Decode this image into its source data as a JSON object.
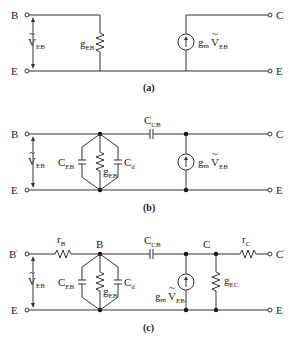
{
  "figure": {
    "panels": [
      {
        "id": "a",
        "caption": "(a)",
        "terminals": {
          "left_top": "B",
          "left_bottom": "E",
          "right_top": "C",
          "right_bottom": "E"
        },
        "voltage": {
          "main": "V",
          "sub": "EB",
          "mark": "~"
        },
        "components": {
          "g_eb": {
            "main": "g",
            "sub": "EB"
          },
          "source": {
            "main": "g",
            "sub_m": "m",
            "v": "V",
            "v_sub": "EB",
            "mark": "~"
          }
        }
      },
      {
        "id": "b",
        "caption": "(b)",
        "terminals": {
          "left_top": "B",
          "left_bottom": "E",
          "right_top": "C",
          "right_bottom": "E"
        },
        "voltage": {
          "main": "V",
          "sub": "EB",
          "mark": "~"
        },
        "components": {
          "c_eb": {
            "main": "C",
            "sub": "EB"
          },
          "g_eb": {
            "main": "g",
            "sub": "EB"
          },
          "c_d": {
            "main": "C",
            "sub": "d"
          },
          "c_cb": {
            "main": "C",
            "sub": "CB"
          },
          "source": {
            "main": "g",
            "sub_m": "m",
            "v": "V",
            "v_sub": "EB",
            "mark": "~"
          }
        }
      },
      {
        "id": "c",
        "caption": "(c)",
        "terminals": {
          "left_top": "B",
          "left_top_prime": "'",
          "left_bottom": "E",
          "right_top": "C",
          "right_top_prime": "'",
          "right_bottom": "E"
        },
        "nodes": {
          "b": "B",
          "c": "C"
        },
        "voltage": {
          "main": "V",
          "sub": "EB",
          "mark": "~"
        },
        "components": {
          "r_b": {
            "main": "r",
            "sub": "B"
          },
          "c_eb": {
            "main": "C",
            "sub": "EB"
          },
          "g_eb": {
            "main": "g",
            "sub": "EB"
          },
          "c_d": {
            "main": "C",
            "sub": "d"
          },
          "c_cb": {
            "main": "C",
            "sub": "CB"
          },
          "source": {
            "main": "g",
            "sub_m": "m",
            "v": "V",
            "v_sub": "EB",
            "mark": "~"
          },
          "g_ec": {
            "main": "g",
            "sub": "EC"
          },
          "r_c": {
            "main": "r",
            "sub": "C"
          }
        }
      }
    ]
  }
}
